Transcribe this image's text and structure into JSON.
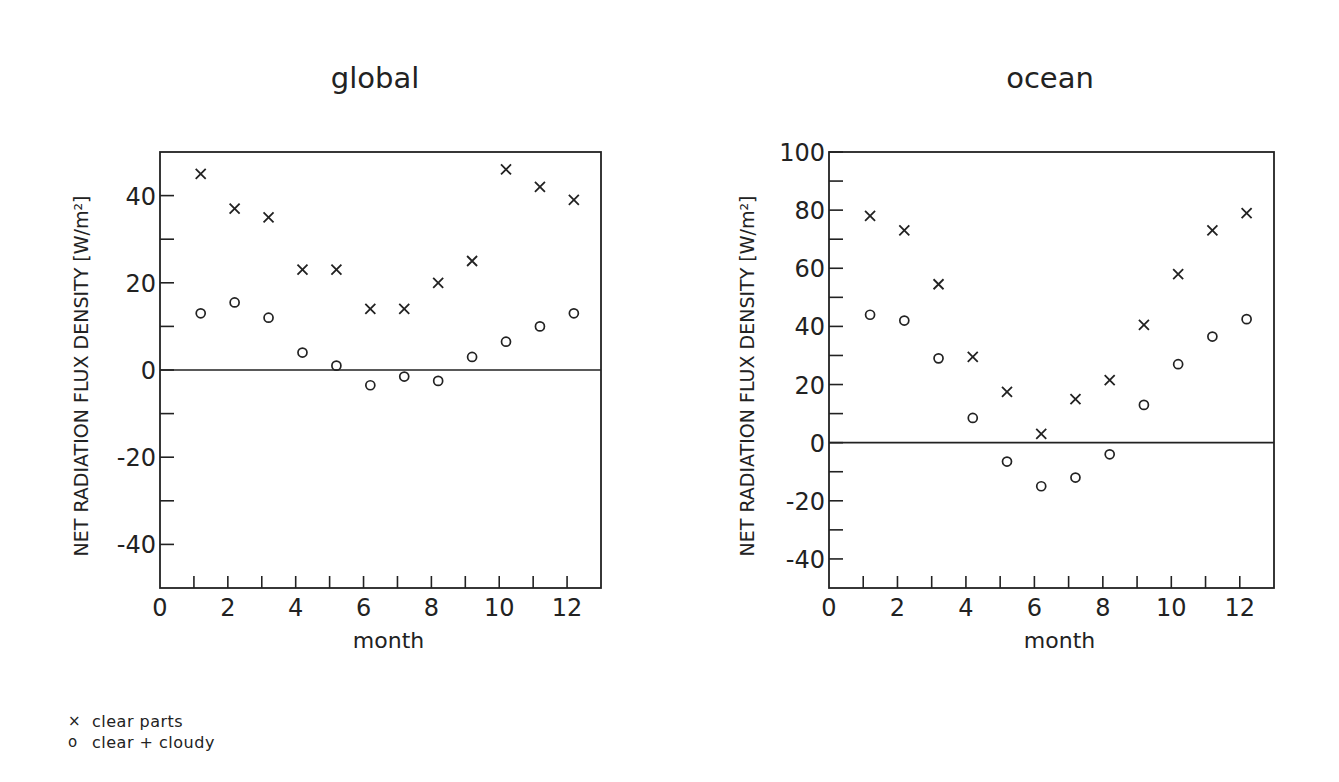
{
  "legend": {
    "items": [
      {
        "symbol": "×",
        "marker": "cross",
        "label": "clear parts"
      },
      {
        "symbol": "o",
        "marker": "circle",
        "label": "clear + cloudy"
      }
    ]
  },
  "chart_data": [
    {
      "type": "scatter",
      "title": "global",
      "xlabel": "month",
      "ylabel": "NET RADIATION FLUX DENSITY [W/m²]",
      "xlim": [
        0,
        13
      ],
      "ylim": [
        -50,
        50
      ],
      "x_ticks": [
        0,
        2,
        4,
        6,
        8,
        10,
        12
      ],
      "x_minor_ticks": [
        1,
        2,
        3,
        4,
        5,
        6,
        7,
        8,
        9,
        10,
        11,
        12
      ],
      "y_ticks": [
        -40,
        -20,
        0,
        20,
        40
      ],
      "y_minor_ticks": [
        -30,
        -10,
        10,
        30
      ],
      "zero_line": true,
      "grid": false,
      "x": [
        1,
        2,
        3,
        4,
        5,
        6,
        7,
        8,
        9,
        10,
        11,
        12
      ],
      "x_plot_offset": 0.2,
      "series": [
        {
          "name": "clear parts",
          "marker": "cross",
          "values": [
            45,
            37,
            35,
            23,
            23,
            14,
            14,
            20,
            25,
            46,
            42,
            39
          ]
        },
        {
          "name": "clear + cloudy",
          "marker": "circle",
          "values": [
            13,
            15.5,
            12,
            4,
            1,
            -3.5,
            -1.5,
            -2.5,
            3,
            6.5,
            10,
            13
          ]
        }
      ]
    },
    {
      "type": "scatter",
      "title": "ocean",
      "xlabel": "month",
      "ylabel": "NET RADIATION FLUX DENSITY [W/m²]",
      "xlim": [
        0,
        13
      ],
      "ylim": [
        -50,
        100
      ],
      "x_ticks": [
        0,
        2,
        4,
        6,
        8,
        10,
        12
      ],
      "x_minor_ticks": [
        1,
        2,
        3,
        4,
        5,
        6,
        7,
        8,
        9,
        10,
        11,
        12
      ],
      "y_ticks": [
        -40,
        -20,
        0,
        20,
        40,
        60,
        80,
        100
      ],
      "y_minor_ticks": [
        -30,
        -10,
        10,
        30,
        50,
        70,
        90
      ],
      "zero_line": true,
      "grid": false,
      "x": [
        1,
        2,
        3,
        4,
        5,
        6,
        7,
        8,
        9,
        10,
        11,
        12
      ],
      "x_plot_offset": 0.2,
      "series": [
        {
          "name": "clear parts",
          "marker": "cross",
          "values": [
            78,
            73,
            54.5,
            29.5,
            17.5,
            3,
            15,
            21.5,
            40.5,
            58,
            73,
            79
          ]
        },
        {
          "name": "clear + cloudy",
          "marker": "circle",
          "values": [
            44,
            42,
            29,
            8.5,
            -6.5,
            -15,
            -12,
            -4,
            13,
            27,
            36.5,
            42.5
          ]
        }
      ]
    }
  ]
}
